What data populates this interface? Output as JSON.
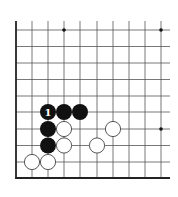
{
  "diagram": {
    "type": "go-board-corner",
    "corner": "bottom-left",
    "colors": {
      "background": "#ffffff",
      "line": "#555555",
      "border": "#222222",
      "black_stone": "#111111",
      "white_stone_fill": "#ffffff",
      "white_stone_stroke": "#444444",
      "label_on_black": "#ffffff",
      "star_point": "#111111"
    },
    "grid": {
      "columns_x": [
        16,
        32,
        48,
        64,
        80,
        97,
        113,
        129,
        145,
        161
      ],
      "rows_y": [
        30,
        46.5,
        63,
        79.5,
        96,
        112,
        129,
        145.5,
        162,
        178
      ],
      "line_top_y": 21,
      "line_right_x": 170,
      "border_left_x": 16,
      "border_bottom_y": 178
    },
    "star_points": [
      {
        "x": 64,
        "y": 30
      },
      {
        "x": 161,
        "y": 30
      },
      {
        "x": 161,
        "y": 129
      }
    ],
    "stones": [
      {
        "color": "black",
        "x": 48,
        "y": 112,
        "label": "1"
      },
      {
        "color": "black",
        "x": 64,
        "y": 112,
        "label": ""
      },
      {
        "color": "black",
        "x": 80,
        "y": 112,
        "label": ""
      },
      {
        "color": "black",
        "x": 48,
        "y": 129,
        "label": ""
      },
      {
        "color": "black",
        "x": 48,
        "y": 145.5,
        "label": ""
      },
      {
        "color": "white",
        "x": 64,
        "y": 129,
        "label": ""
      },
      {
        "color": "white",
        "x": 64,
        "y": 145.5,
        "label": ""
      },
      {
        "color": "white",
        "x": 32,
        "y": 162,
        "label": ""
      },
      {
        "color": "white",
        "x": 48,
        "y": 162,
        "label": ""
      },
      {
        "color": "white",
        "x": 97,
        "y": 145.5,
        "label": ""
      },
      {
        "color": "white",
        "x": 113,
        "y": 129,
        "label": ""
      }
    ],
    "stone_radius": 8
  }
}
